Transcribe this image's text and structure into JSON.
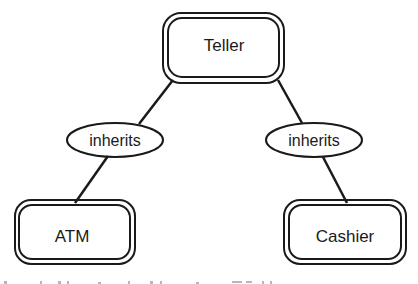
{
  "diagram": {
    "nodes": {
      "teller": {
        "label": "Teller",
        "style": "double-rounded-box"
      },
      "atm": {
        "label": "ATM",
        "style": "double-rounded-box"
      },
      "cashier": {
        "label": "Cashier",
        "style": "double-rounded-box"
      }
    },
    "relations": {
      "left": {
        "label": "inherits",
        "from": "ATM",
        "to": "Teller"
      },
      "right": {
        "label": "inherits",
        "from": "Cashier",
        "to": "Teller"
      }
    },
    "colors": {
      "ink": "#1a1a1a",
      "background": "#ffffff"
    }
  }
}
